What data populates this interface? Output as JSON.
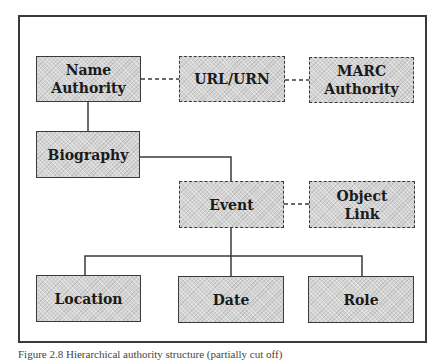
{
  "diagram": {
    "nodes": {
      "name_authority": {
        "label_line1": "Name",
        "label_line2": "Authority",
        "style": "solid"
      },
      "url_urn": {
        "label": "URL/URN",
        "style": "dashed"
      },
      "marc_authority": {
        "label_line1": "MARC",
        "label_line2": "Authority",
        "style": "dashed"
      },
      "biography": {
        "label": "Biography",
        "style": "solid"
      },
      "event": {
        "label": "Event",
        "style": "dashed"
      },
      "object_link": {
        "label_line1": "Object",
        "label_line2": "Link",
        "style": "dashed"
      },
      "location": {
        "label": "Location",
        "style": "solid"
      },
      "date": {
        "label": "Date",
        "style": "solid"
      },
      "role": {
        "label": "Role",
        "style": "solid"
      }
    },
    "edges": [
      {
        "from": "Name Authority",
        "to": "URL/URN",
        "style": "dashed"
      },
      {
        "from": "URL/URN",
        "to": "MARC Authority",
        "style": "dashed"
      },
      {
        "from": "Name Authority",
        "to": "Biography",
        "style": "solid"
      },
      {
        "from": "Biography",
        "to": "Event",
        "style": "solid"
      },
      {
        "from": "Event",
        "to": "Object Link",
        "style": "dashed"
      },
      {
        "from": "Event",
        "to": "Location",
        "style": "solid"
      },
      {
        "from": "Event",
        "to": "Date",
        "style": "solid"
      },
      {
        "from": "Event",
        "to": "Role",
        "style": "solid"
      }
    ],
    "colors": {
      "box_fill": "#d4d4d4",
      "stroke": "#3a3a3a",
      "background": "#ffffff"
    }
  },
  "caption": {
    "text": "Figure 2.8   Hierarchical authority structure (partially cut off)"
  }
}
